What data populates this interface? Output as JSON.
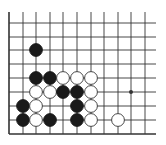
{
  "diagram": {
    "type": "go-board-fragment",
    "colors": {
      "background": "#ffffff",
      "line": "#333333",
      "black_stone": "#1a1a1a",
      "white_stone": "#ffffff",
      "white_stone_edge": "#333333"
    },
    "grid": {
      "col_x": [
        9,
        23,
        36,
        50,
        63,
        77,
        91,
        104,
        118,
        131,
        145
      ],
      "row_y": [
        23,
        37,
        50,
        64,
        78,
        92,
        106,
        120,
        134
      ],
      "right_extent": 156,
      "top_extent": 12,
      "edges": [
        "left",
        "bottom"
      ]
    },
    "star_points": [
      {
        "col": 9,
        "row": 5
      }
    ],
    "stones": [
      {
        "color": "black",
        "col": 2,
        "row": 2
      },
      {
        "color": "black",
        "col": 2,
        "row": 4
      },
      {
        "color": "black",
        "col": 3,
        "row": 4
      },
      {
        "color": "white",
        "col": 4,
        "row": 4
      },
      {
        "color": "white",
        "col": 5,
        "row": 4
      },
      {
        "color": "white",
        "col": 6,
        "row": 4
      },
      {
        "color": "white",
        "col": 2,
        "row": 5
      },
      {
        "color": "white",
        "col": 3,
        "row": 5
      },
      {
        "color": "black",
        "col": 4,
        "row": 5
      },
      {
        "color": "black",
        "col": 5,
        "row": 5
      },
      {
        "color": "white",
        "col": 6,
        "row": 5
      },
      {
        "color": "black",
        "col": 1,
        "row": 6
      },
      {
        "color": "white",
        "col": 2,
        "row": 6
      },
      {
        "color": "black",
        "col": 5,
        "row": 6
      },
      {
        "color": "white",
        "col": 6,
        "row": 6
      },
      {
        "color": "black",
        "col": 1,
        "row": 7
      },
      {
        "color": "white",
        "col": 2,
        "row": 7
      },
      {
        "color": "black",
        "col": 3,
        "row": 7
      },
      {
        "color": "black",
        "col": 5,
        "row": 7
      },
      {
        "color": "white",
        "col": 6,
        "row": 7
      },
      {
        "color": "white",
        "col": 8,
        "row": 7
      }
    ]
  }
}
